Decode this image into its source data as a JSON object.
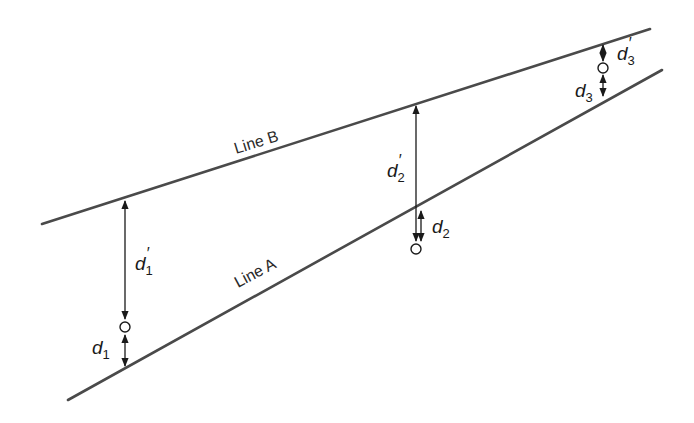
{
  "diagram": {
    "lines": [
      {
        "id": "line-b",
        "label": "Line B",
        "x1": 42,
        "y1": 224,
        "x2": 650,
        "y2": 29
      },
      {
        "id": "line-a",
        "label": "Line A",
        "x1": 68,
        "y1": 400,
        "x2": 662,
        "y2": 70
      }
    ],
    "labels": {
      "line_b": "Line B",
      "line_a": "Line A",
      "d1": "d",
      "d1_sub": "1",
      "d1p": "d",
      "d1p_sub": "1",
      "d1p_prime": "′",
      "d2": "d",
      "d2_sub": "2",
      "d2p": "d",
      "d2p_sub": "2",
      "d2p_prime": "′",
      "d3": "d",
      "d3_sub": "3",
      "d3p": "d",
      "d3p_sub": "3",
      "d3p_prime": "′"
    },
    "points": [
      {
        "id": 1,
        "x": 125,
        "y": 327
      },
      {
        "id": 2,
        "x": 416,
        "y": 249
      },
      {
        "id": 3,
        "x": 603,
        "y": 68
      }
    ],
    "colors": {
      "line": "#4a4a4a",
      "arrow": "#1a1a1a",
      "background": "#ffffff"
    }
  }
}
